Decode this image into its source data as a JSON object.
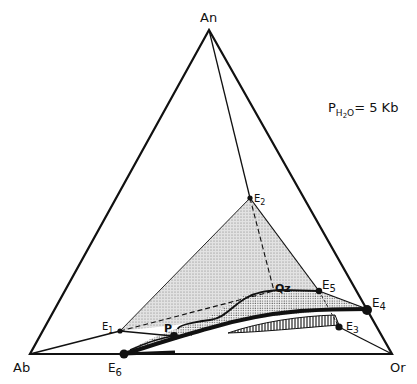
{
  "diagram": {
    "type": "ternary-phase-diagram",
    "condition": {
      "prefix": "P",
      "subscript": "H",
      "subscript2": "2",
      "subscript3": "O",
      "value": "= 5  Kb"
    },
    "vertices": {
      "top": "An",
      "left": "Ab",
      "right": "Or"
    },
    "points": {
      "e1": {
        "main": "E",
        "sub": "1"
      },
      "e2": {
        "main": "E",
        "sub": "2"
      },
      "e3": {
        "main": "E",
        "sub": "3"
      },
      "e4": {
        "main": "E",
        "sub": "4"
      },
      "e5": {
        "main": "E",
        "sub": "5"
      },
      "e6": {
        "main": "E",
        "sub": "6"
      },
      "qz": "Qz",
      "p": "P"
    },
    "colors": {
      "line": "#111111",
      "shade_light": "#d4d4d4",
      "shade_stipple": "#bdbdbd",
      "background": "#ffffff"
    }
  }
}
